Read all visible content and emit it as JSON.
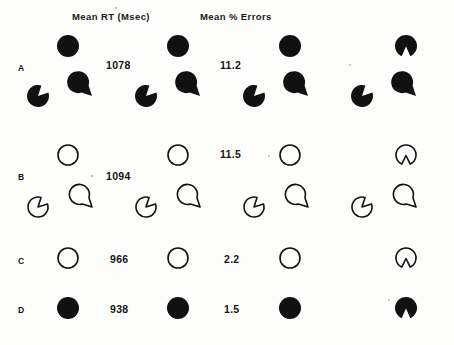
{
  "figure": {
    "headers": [
      {
        "text": "Mean RT  (Msec)",
        "x": 72,
        "y": 11
      },
      {
        "text": "Mean % Errors",
        "x": 200,
        "y": 11
      }
    ],
    "rows": [
      {
        "id": "A",
        "label": "A",
        "label_x": 18,
        "label_y": 63,
        "fill": "solid",
        "mean_rt": "1078",
        "mean_rt_x": 106,
        "mean_rt_y": 59,
        "mean_pct_errors": "11.2",
        "mean_pct_errors_x": 220,
        "mean_pct_errors_y": 59,
        "circle_y": 46,
        "circle_r": 11,
        "circle_xs": [
          68,
          178,
          290
        ],
        "notched_x": 406,
        "notched_y": 46,
        "has_pacman_row": true,
        "pacman_y": 96,
        "pacman_r": 11,
        "pacman_xs": [
          38,
          92,
          146,
          200,
          254,
          308,
          362,
          416
        ]
      },
      {
        "id": "B",
        "label": "B",
        "label_x": 18,
        "label_y": 172,
        "fill": "outline",
        "mean_rt": "1094",
        "mean_rt_x": 106,
        "mean_rt_y": 170,
        "mean_pct_errors": "11.5",
        "mean_pct_errors_x": 220,
        "mean_pct_errors_y": 148,
        "circle_y": 155,
        "circle_r": 11,
        "circle_xs": [
          68,
          178,
          290
        ],
        "notched_x": 406,
        "notched_y": 155,
        "has_pacman_row": true,
        "pacman_y": 207,
        "pacman_r": 11,
        "pacman_xs": [
          38,
          92,
          146,
          200,
          254,
          308,
          362,
          416
        ]
      },
      {
        "id": "C",
        "label": "C",
        "label_x": 18,
        "label_y": 256,
        "fill": "outline",
        "mean_rt": "966",
        "mean_rt_x": 110,
        "mean_rt_y": 253,
        "mean_pct_errors": "2.2",
        "mean_pct_errors_x": 224,
        "mean_pct_errors_y": 253,
        "circle_y": 258,
        "circle_r": 11,
        "circle_xs": [
          68,
          178,
          290
        ],
        "notched_x": 406,
        "notched_y": 258,
        "has_pacman_row": false
      },
      {
        "id": "D",
        "label": "D",
        "label_x": 18,
        "label_y": 305,
        "fill": "solid",
        "mean_rt": "938",
        "mean_rt_x": 110,
        "mean_rt_y": 303,
        "mean_pct_errors": "1.5",
        "mean_pct_errors_x": 224,
        "mean_pct_errors_y": 303,
        "circle_y": 308,
        "circle_r": 11,
        "circle_xs": [
          68,
          178,
          290
        ],
        "notched_x": 406,
        "notched_y": 308,
        "has_pacman_row": false
      }
    ],
    "colors": {
      "ink": "#111111",
      "paper": "#fdfdfc"
    },
    "specks": [
      {
        "x": 115,
        "y": 7,
        "size": 2
      },
      {
        "x": 349,
        "y": 64,
        "size": 2
      },
      {
        "x": 268,
        "y": 155,
        "size": 2
      },
      {
        "x": 91,
        "y": 175,
        "size": 2
      },
      {
        "x": 388,
        "y": 299,
        "size": 2
      }
    ]
  }
}
